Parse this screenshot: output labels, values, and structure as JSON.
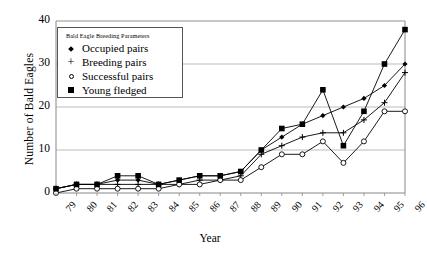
{
  "chart_data": {
    "type": "line",
    "title": "",
    "xlabel": "Year",
    "ylabel": "Number of Bald Eagles",
    "ylim": [
      0,
      40
    ],
    "yticks": [
      0,
      10,
      20,
      30,
      40
    ],
    "grid": true,
    "legend_position": "upper-left-inside",
    "legend_title": "Bald Eagle Breeding Parameters",
    "categories": [
      "79",
      "80",
      "81",
      "82",
      "83",
      "84",
      "85",
      "86",
      "87",
      "88",
      "89",
      "90",
      "91",
      "92",
      "93",
      "94",
      "95",
      "96"
    ],
    "series": [
      {
        "name": "Occupied pairs",
        "marker": "diamond",
        "values": [
          1,
          2,
          2,
          3,
          3,
          2,
          3,
          4,
          4,
          5,
          10,
          13,
          16,
          18,
          20,
          22,
          25,
          30
        ]
      },
      {
        "name": "Breeding pairs",
        "marker": "plus",
        "values": [
          1,
          2,
          2,
          2,
          2,
          2,
          2,
          3,
          3,
          4,
          9,
          11,
          13,
          14,
          14,
          17,
          21,
          28
        ]
      },
      {
        "name": "Successful pairs",
        "marker": "open-circle",
        "values": [
          0,
          1,
          1,
          1,
          1,
          1,
          2,
          2,
          3,
          3,
          6,
          9,
          9,
          12,
          7,
          12,
          19,
          19
        ]
      },
      {
        "name": "Young fledged",
        "marker": "filled-square",
        "values": [
          1,
          2,
          2,
          4,
          4,
          2,
          3,
          4,
          4,
          5,
          10,
          15,
          16,
          24,
          11,
          19,
          30,
          38
        ]
      }
    ]
  },
  "axis": {
    "y_title": "Number of Bald Eagles",
    "x_title": "Year"
  },
  "legend": {
    "title": "Bald Eagle Breeding Parameters",
    "items": [
      {
        "label": "Occupied pairs",
        "marker": "diamond-icon"
      },
      {
        "label": "Breeding pairs",
        "marker": "plus-icon"
      },
      {
        "label": "Successful pairs",
        "marker": "open-circle-icon"
      },
      {
        "label": "Young fledged",
        "marker": "filled-square-icon"
      }
    ]
  },
  "colors": {
    "line": "#000000",
    "grid": "#aaaaaa",
    "frame": "#888888",
    "background": "#ffffff"
  }
}
